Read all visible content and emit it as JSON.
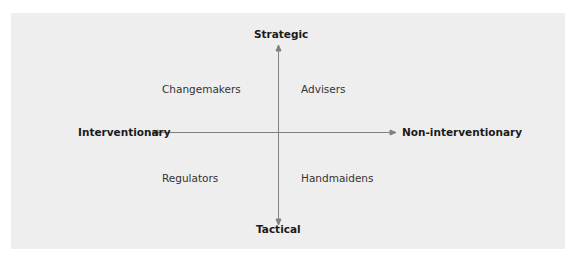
{
  "axes": {
    "top": "Strategic",
    "bottom": "Tactical",
    "left": "Interventionary",
    "right": "Non-interventionary"
  },
  "quadrants": {
    "top_left": "Changemakers",
    "top_right": "Advisers",
    "bottom_left": "Regulators",
    "bottom_right": "Handmaidens"
  },
  "colors": {
    "panel": "#eeeeee",
    "axis_line": "#777777",
    "text": "#1a1a1a"
  }
}
